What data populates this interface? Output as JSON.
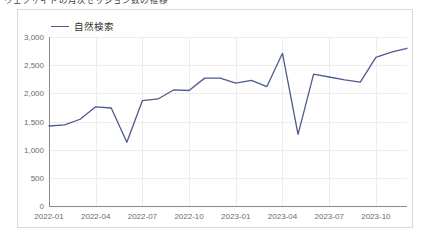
{
  "top_caption": "ウェブサイトの月次セッション数の推移",
  "panel": {
    "border_color": "#d9d9d9",
    "background": "#ffffff"
  },
  "legend": {
    "position": "top-left",
    "entries": [
      {
        "label": "自然検索",
        "color": "#4e5a92",
        "marker": "line"
      }
    ]
  },
  "chart_data": {
    "type": "line",
    "title": "",
    "subtitle": "",
    "xlabel": "",
    "ylabel": "",
    "grid": true,
    "legend_position": "top-left",
    "ylim": [
      0,
      3000
    ],
    "yticks": [
      0,
      500,
      1000,
      1500,
      2000,
      2500,
      3000
    ],
    "ytick_labels": [
      "0",
      "500",
      "1,000",
      "1,500",
      "2,000",
      "2,500",
      "3,000"
    ],
    "xtick_labels": [
      "2022-01",
      "2022-04",
      "2022-07",
      "2022-10",
      "2023-01",
      "2023-04",
      "2023-07",
      "2023-10"
    ],
    "x": [
      "2022-01",
      "2022-02",
      "2022-03",
      "2022-04",
      "2022-05",
      "2022-06",
      "2022-07",
      "2022-08",
      "2022-09",
      "2022-10",
      "2022-11",
      "2022-12",
      "2023-01",
      "2023-02",
      "2023-03",
      "2023-04",
      "2023-05",
      "2023-06",
      "2023-07",
      "2023-08",
      "2023-09",
      "2023-10",
      "2023-11",
      "2023-12"
    ],
    "series": [
      {
        "name": "自然検索",
        "color": "#4e5a92",
        "values": [
          1420,
          1440,
          1540,
          1760,
          1740,
          1130,
          1870,
          1900,
          2060,
          2050,
          2270,
          2270,
          2180,
          2230,
          2120,
          2710,
          1270,
          2340,
          2290,
          2240,
          2200,
          2640,
          2730,
          2800
        ]
      }
    ]
  }
}
